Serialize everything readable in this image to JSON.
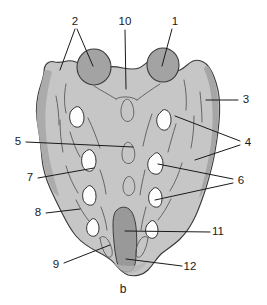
{
  "figure": {
    "caption_letter": "b",
    "labels": [
      {
        "id": "1",
        "text": "1",
        "x": 175,
        "y": 22
      },
      {
        "id": "2",
        "text": "2",
        "x": 75,
        "y": 22
      },
      {
        "id": "3",
        "text": "3",
        "x": 246,
        "y": 100
      },
      {
        "id": "4",
        "text": "4",
        "x": 248,
        "y": 143
      },
      {
        "id": "5",
        "text": "5",
        "x": 18,
        "y": 142
      },
      {
        "id": "6",
        "text": "6",
        "x": 241,
        "y": 181
      },
      {
        "id": "7",
        "text": "7",
        "x": 30,
        "y": 178
      },
      {
        "id": "8",
        "text": "8",
        "x": 38,
        "y": 213
      },
      {
        "id": "9",
        "text": "9",
        "x": 56,
        "y": 265
      },
      {
        "id": "10",
        "text": "10",
        "x": 125,
        "y": 22
      },
      {
        "id": "11",
        "text": "11",
        "x": 218,
        "y": 232
      },
      {
        "id": "12",
        "text": "12",
        "x": 190,
        "y": 267
      }
    ]
  },
  "colors": {
    "bone_fill": "#c6c6c6",
    "bone_outline": "#3a3a3a",
    "articular_process_fill": "#a3a3a3",
    "lateral_edge_fill": "#adadad",
    "sacral_canal_fill": "#9a9a9a",
    "foramen_fill": "#fdfdfd",
    "ridge_stroke": "#5a5a5a",
    "leader_stroke": "#1a1a1a",
    "label_text": "#1a1a1a",
    "background": "#ffffff"
  }
}
